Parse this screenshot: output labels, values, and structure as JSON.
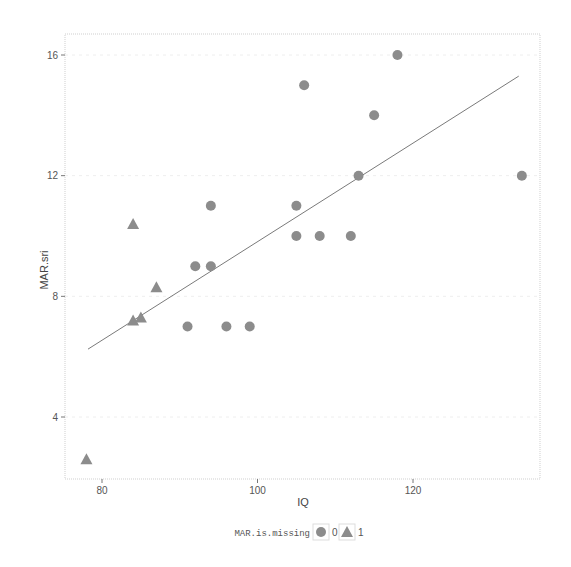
{
  "chart_data": {
    "type": "scatter",
    "title": "",
    "xlabel": "IQ",
    "ylabel": "MAR.sri",
    "xlim": [
      75,
      137
    ],
    "ylim": [
      1.9,
      16.8
    ],
    "x_ticks": [
      80,
      100,
      120
    ],
    "y_ticks": [
      4,
      8,
      12,
      16
    ],
    "grid": true,
    "legend": {
      "position": "bottom",
      "title": "MAR.is.missing",
      "entries": [
        {
          "label": "0",
          "shape": "circle"
        },
        {
          "label": "1",
          "shape": "triangle"
        }
      ]
    },
    "series": [
      {
        "name": "0",
        "shape": "circle",
        "color": "#8c8c8c",
        "points": [
          {
            "x": 91,
            "y": 7
          },
          {
            "x": 92,
            "y": 9
          },
          {
            "x": 94,
            "y": 9
          },
          {
            "x": 94,
            "y": 11
          },
          {
            "x": 96,
            "y": 7
          },
          {
            "x": 99,
            "y": 7
          },
          {
            "x": 105,
            "y": 10
          },
          {
            "x": 105,
            "y": 11
          },
          {
            "x": 106,
            "y": 15
          },
          {
            "x": 108,
            "y": 10
          },
          {
            "x": 112,
            "y": 10
          },
          {
            "x": 113,
            "y": 12
          },
          {
            "x": 115,
            "y": 14
          },
          {
            "x": 118,
            "y": 16
          },
          {
            "x": 134,
            "y": 12
          }
        ]
      },
      {
        "name": "1",
        "shape": "triangle",
        "color": "#8c8c8c",
        "points": [
          {
            "x": 78,
            "y": 2.6
          },
          {
            "x": 84,
            "y": 7.2
          },
          {
            "x": 84,
            "y": 10.4
          },
          {
            "x": 85,
            "y": 7.3
          },
          {
            "x": 87,
            "y": 8.3
          }
        ]
      }
    ],
    "fit_line": {
      "type": "linear",
      "x": [
        78.2,
        133.6
      ],
      "y": [
        6.25,
        15.3
      ],
      "color": "#7a7a7a"
    }
  },
  "layout": {
    "panel": {
      "left": 65,
      "top": 34,
      "right": 540,
      "bottom": 479
    },
    "x_map": {
      "v0": 80,
      "p0": 102,
      "v1": 120,
      "p1": 413
    },
    "y_map": {
      "v0": 16,
      "p0": 55,
      "v1": 4,
      "p1": 417
    }
  }
}
